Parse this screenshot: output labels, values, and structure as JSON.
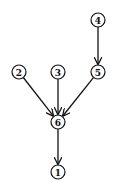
{
  "diagram": {
    "type": "directed-tree",
    "nodes": [
      {
        "id": "4",
        "label": "4",
        "x": 98,
        "y": 20
      },
      {
        "id": "2",
        "label": "2",
        "x": 19,
        "y": 72
      },
      {
        "id": "3",
        "label": "3",
        "x": 58,
        "y": 72
      },
      {
        "id": "5",
        "label": "5",
        "x": 98,
        "y": 72
      },
      {
        "id": "6",
        "label": "6",
        "x": 58,
        "y": 122
      },
      {
        "id": "1",
        "label": "1",
        "x": 58,
        "y": 172
      }
    ],
    "edges": [
      {
        "from": "4",
        "to": "5"
      },
      {
        "from": "2",
        "to": "6"
      },
      {
        "from": "3",
        "to": "6"
      },
      {
        "from": "5",
        "to": "6"
      },
      {
        "from": "6",
        "to": "1"
      }
    ],
    "colors": {
      "stroke": "#111111",
      "background": "#ffffff"
    }
  }
}
